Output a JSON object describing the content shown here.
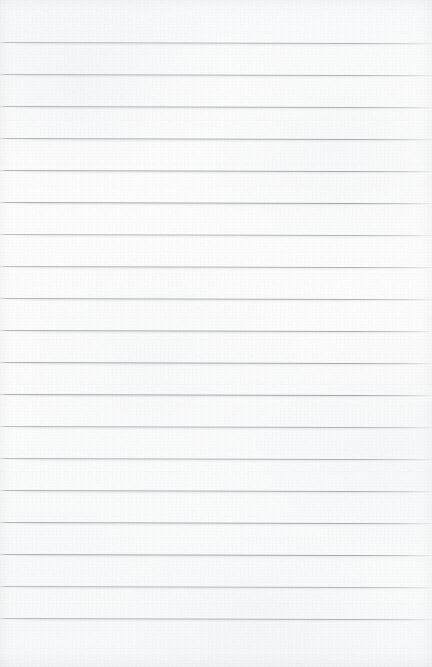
{
  "document": {
    "kind": "lined-notebook-paper",
    "title": "Blank lined notebook page",
    "orientation": "portrait",
    "width_px": 432,
    "height_px": 667,
    "written_content": "",
    "has_text": false,
    "has_margin_rule": false,
    "has_holes": false
  },
  "colors": {
    "paper": "#fcfcfc",
    "paper_shade": "#f6f7f8",
    "rule_line": "#a0a5aa",
    "rule_line_faded": "#c2c6ca",
    "page_edge": "#f2f3f4"
  },
  "ruling": {
    "line_count": 19,
    "first_line_y": 42,
    "line_spacing_px": 32,
    "line_thickness_px": 1,
    "tilt_deg": 0.16,
    "top_margin_px": 42,
    "bottom_margin_px": 49,
    "lines_y": [
      42,
      74,
      106,
      138,
      170,
      202,
      234,
      266,
      298,
      330,
      362,
      394,
      426,
      458,
      490,
      522,
      554,
      586,
      618
    ]
  }
}
